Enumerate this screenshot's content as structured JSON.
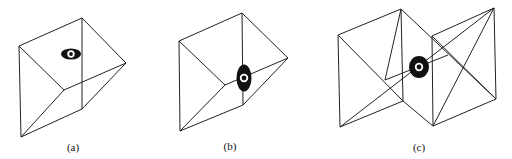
{
  "figures": [
    {
      "id": "a",
      "label": "(a)",
      "label_pos": [
        73,
        151
      ],
      "edges": [
        [
          [
            82,
            18
          ],
          [
            19,
            46
          ]
        ],
        [
          [
            82,
            18
          ],
          [
            126,
            63
          ]
        ],
        [
          [
            82,
            18
          ],
          [
            82,
            109
          ]
        ],
        [
          [
            19,
            46
          ],
          [
            21,
            137
          ]
        ],
        [
          [
            19,
            46
          ],
          [
            64,
            90
          ]
        ],
        [
          [
            64,
            90
          ],
          [
            126,
            63
          ]
        ],
        [
          [
            64,
            90
          ],
          [
            21,
            137
          ]
        ],
        [
          [
            126,
            63
          ],
          [
            82,
            109
          ]
        ],
        [
          [
            82,
            109
          ],
          [
            21,
            137
          ]
        ]
      ],
      "eye": {
        "cx": 71,
        "cy": 54,
        "rx": 10,
        "ry": 5.5,
        "inner_r": 2.5
      }
    },
    {
      "id": "b",
      "label": "(b)",
      "label_pos": [
        230,
        150
      ],
      "edges": [
        [
          [
            242,
            13
          ],
          [
            179,
            41
          ]
        ],
        [
          [
            242,
            13
          ],
          [
            288,
            58
          ]
        ],
        [
          [
            242,
            13
          ],
          [
            243,
            105
          ]
        ],
        [
          [
            179,
            41
          ],
          [
            180,
            131
          ]
        ],
        [
          [
            179,
            41
          ],
          [
            225,
            85
          ]
        ],
        [
          [
            225,
            85
          ],
          [
            288,
            58
          ]
        ],
        [
          [
            225,
            85
          ],
          [
            180,
            131
          ]
        ],
        [
          [
            288,
            58
          ],
          [
            243,
            105
          ]
        ],
        [
          [
            243,
            105
          ],
          [
            180,
            131
          ]
        ]
      ],
      "eye": {
        "cx": 244,
        "cy": 78,
        "rx": 7.5,
        "ry": 13.5,
        "inner_r": 3
      }
    },
    {
      "id": "c",
      "label": "(c)",
      "label_pos": [
        419,
        151
      ],
      "edges": [
        [
          [
            338,
            35
          ],
          [
            401,
            9
          ]
        ],
        [
          [
            338,
            35
          ],
          [
            340,
            127
          ]
        ],
        [
          [
            401,
            9
          ],
          [
            403,
            101
          ]
        ],
        [
          [
            340,
            127
          ],
          [
            403,
            101
          ]
        ],
        [
          [
            401,
            9
          ],
          [
            496,
            99
          ]
        ],
        [
          [
            403,
            101
          ],
          [
            433,
            126
          ]
        ],
        [
          [
            432,
            36
          ],
          [
            494,
            8
          ]
        ],
        [
          [
            432,
            36
          ],
          [
            433,
            126
          ]
        ],
        [
          [
            494,
            8
          ],
          [
            496,
            99
          ]
        ],
        [
          [
            433,
            126
          ],
          [
            496,
            99
          ]
        ],
        [
          [
            338,
            35
          ],
          [
            403,
            101
          ]
        ],
        [
          [
            340,
            127
          ],
          [
            494,
            8
          ]
        ],
        [
          [
            385,
            80
          ],
          [
            448,
            55
          ]
        ],
        [
          [
            432,
            36
          ],
          [
            496,
            99
          ]
        ],
        [
          [
            433,
            126
          ],
          [
            494,
            8
          ]
        ],
        [
          [
            401,
            9
          ],
          [
            385,
            80
          ]
        ]
      ],
      "eye": {
        "cx": 419,
        "cy": 67,
        "rx": 10,
        "ry": 11,
        "inner_r": 3
      }
    }
  ]
}
